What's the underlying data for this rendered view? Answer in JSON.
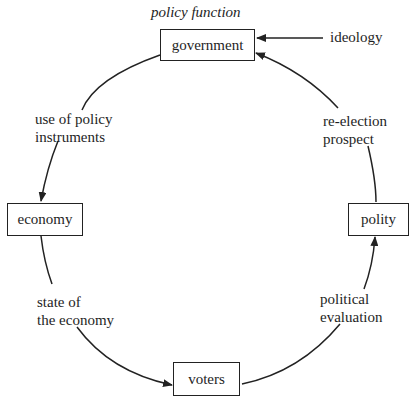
{
  "diagram": {
    "title": "policy function",
    "nodes": {
      "government": "government",
      "economy": "economy",
      "voters": "voters",
      "polity": "polity"
    },
    "external_input": "ideology",
    "edges": {
      "government_to_economy": [
        "use of policy",
        "instruments"
      ],
      "economy_to_voters": [
        "state of",
        "the economy"
      ],
      "voters_to_polity": [
        "political",
        "evaluation"
      ],
      "polity_to_government": [
        "re-election",
        "prospect"
      ]
    },
    "colors": {
      "line": "#222222",
      "text": "#1e1e1e",
      "background": "#ffffff"
    }
  }
}
